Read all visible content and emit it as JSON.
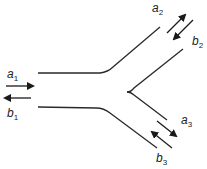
{
  "diagram": {
    "type": "y-junction-three-port",
    "colors": {
      "line": "#2a2a2a",
      "arrow": "#1a1a1a",
      "background": "#ffffff"
    },
    "ports": [
      {
        "id": "port-1",
        "incident": {
          "name": "a",
          "sub": "1"
        },
        "reflected": {
          "name": "b",
          "sub": "1"
        }
      },
      {
        "id": "port-2",
        "incident": {
          "name": "a",
          "sub": "2"
        },
        "reflected": {
          "name": "b",
          "sub": "2"
        }
      },
      {
        "id": "port-3",
        "incident": {
          "name": "a",
          "sub": "3"
        },
        "reflected": {
          "name": "b",
          "sub": "3"
        }
      }
    ]
  }
}
